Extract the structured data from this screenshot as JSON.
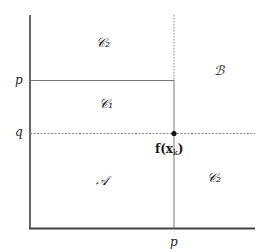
{
  "diagram": {
    "axes": {
      "x_tick_label": "p",
      "y_tick_labels": {
        "p": "p",
        "q": "q"
      }
    },
    "regions": {
      "c2_top": "𝒞₂",
      "c1": "𝒞₁",
      "b": "ℬ",
      "a": "𝒜",
      "c2_right": "𝒞₂"
    },
    "point": {
      "label": "f(x",
      "subscript": "k",
      "close": ")"
    },
    "colors": {
      "axis": "#444444",
      "line": "#777777",
      "dashed": "#888888",
      "dot": "#111111"
    }
  }
}
